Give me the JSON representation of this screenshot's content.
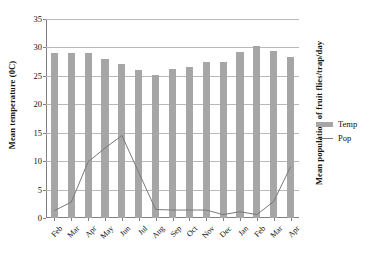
{
  "chart_data": {
    "type": "bar",
    "title": "",
    "xlabel": "",
    "ylabel": "Mean temperature (0C)",
    "ylabel_right": "Mean population of fruit flies/trap/day",
    "categories": [
      "Feb",
      "Mar",
      "Apr",
      "May",
      "Jun",
      "Jul",
      "Aug",
      "Sep",
      "Oct",
      "Nov",
      "Dec",
      "Jan",
      "Feb",
      "Mar",
      "Apr"
    ],
    "ylim": [
      0,
      35
    ],
    "yticks": [
      0,
      5,
      10,
      15,
      20,
      25,
      30,
      35
    ],
    "ytick_labels": [
      "0",
      "5",
      "10",
      "15",
      "20",
      "25",
      "30",
      "35"
    ],
    "grid": true,
    "legend_position": "right",
    "series": [
      {
        "name": "Temp",
        "type": "bar",
        "color": "#a6a6a6",
        "values": [
          29.0,
          29.0,
          29.0,
          28.0,
          27.1,
          26.1,
          25.2,
          26.2,
          26.5,
          27.5,
          27.4,
          29.2,
          30.3,
          29.3,
          28.4
        ]
      },
      {
        "name": "Pop",
        "type": "line",
        "color": "#7a7a7a",
        "values": [
          1.3,
          2.8,
          9.9,
          12.3,
          14.5,
          8.0,
          1.5,
          1.4,
          1.4,
          1.4,
          0.6,
          1.1,
          0.6,
          2.9,
          9.0
        ]
      }
    ]
  },
  "legend": {
    "items": [
      {
        "label": "Temp",
        "marker": "bar-swatch"
      },
      {
        "label": "Pop",
        "marker": "line-swatch"
      }
    ]
  },
  "colors": {
    "bar": "#a6a6a6",
    "line": "#7a7a7a",
    "grid": "#b9b9b9",
    "axis": "#808080",
    "text": "#111111",
    "background": "#ffffff"
  }
}
